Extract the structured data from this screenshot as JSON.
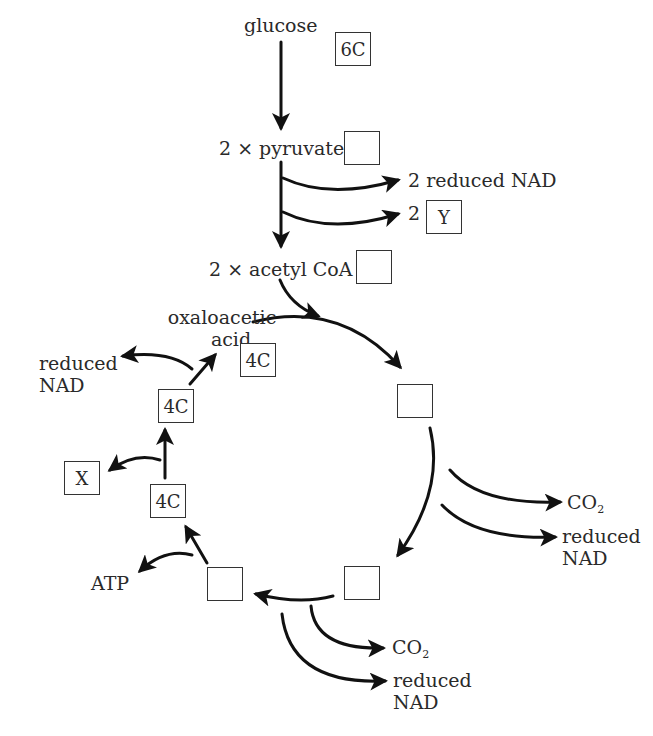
{
  "diagram": {
    "type": "Krebs cycle / respiration pathway",
    "top": {
      "glucose": {
        "label": "glucose",
        "box": "6C"
      },
      "pyruvate": {
        "label": "2 × pyruvate",
        "box": ""
      },
      "link_outputs": [
        {
          "label": "2 reduced NAD"
        },
        {
          "prefix": "2",
          "box": "Y"
        }
      ],
      "acetyl_coa": {
        "label": "2 × acetyl CoA",
        "box": ""
      }
    },
    "cycle": {
      "oxaloacetic": {
        "line1": "oxaloacetic",
        "line2": "acid",
        "box": "4C"
      },
      "top_right_box": "",
      "right_outputs": [
        {
          "main": "CO",
          "sub": "2"
        },
        {
          "line1": "reduced",
          "line2": "NAD"
        }
      ],
      "bottom_right_box": "",
      "bottom_outputs": [
        {
          "main": "CO",
          "sub": "2"
        },
        {
          "line1": "reduced",
          "line2": "NAD"
        }
      ],
      "bottom_left_box": "",
      "atp_label": "ATP",
      "left_lower_box": "4C",
      "x_box": "X",
      "left_upper_box": "4C",
      "left_nad": {
        "line1": "reduced",
        "line2": "NAD"
      }
    }
  }
}
